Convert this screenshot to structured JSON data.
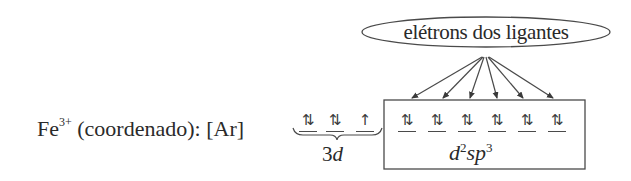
{
  "diagram": {
    "ion_label": {
      "element": "Fe",
      "charge": "3+",
      "description": "(coordenado): [Ar]"
    },
    "ligand_bubble": {
      "text": "elétrons dos ligantes"
    },
    "orbitals_3d": {
      "label_prefix": "3",
      "label_suffix": "d",
      "boxes": [
        {
          "electrons": "⇅",
          "glyph": "1⇂"
        },
        {
          "electrons": "⇅",
          "glyph": "1⇂"
        },
        {
          "electrons": "↑",
          "glyph": "1"
        }
      ]
    },
    "orbitals_hybrid": {
      "label": {
        "d": "d",
        "d_exp": "2",
        "sp": "sp",
        "p_exp": "3"
      },
      "boxes": [
        {
          "electrons": "⇅",
          "glyph": "1⇂"
        },
        {
          "electrons": "⇅",
          "glyph": "1⇂"
        },
        {
          "electrons": "⇅",
          "glyph": "1⇂"
        },
        {
          "electrons": "⇅",
          "glyph": "1⇂"
        },
        {
          "electrons": "⇅",
          "glyph": "1⇂"
        },
        {
          "electrons": "⇅",
          "glyph": "1⇂"
        }
      ],
      "arrow_count": 6
    }
  }
}
